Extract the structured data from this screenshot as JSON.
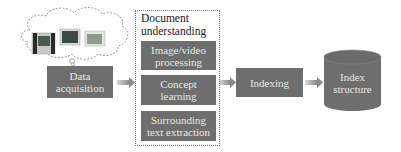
{
  "nodes": {
    "data_acquisition": "Data acquisition",
    "document_understanding": {
      "title": "Document understanding",
      "steps": [
        "Image/video processing",
        "Concept learning",
        "Surrounding text extraction"
      ]
    },
    "indexing": "Indexing",
    "index_structure": "Index structure"
  },
  "labels": {
    "data_acquisition_l1": "Data",
    "data_acquisition_l2": "acquisition",
    "doc_title_l1": "Document",
    "doc_title_l2": "understanding",
    "step1_l1": "Image/video",
    "step1_l2": "processing",
    "step2_l1": "Concept",
    "step2_l2": "learning",
    "step3_l1": "Surrounding",
    "step3_l2": "text extraction",
    "indexing": "Indexing",
    "index_l1": "Index",
    "index_l2": "structure"
  },
  "edges": [
    [
      "Data acquisition",
      "Document understanding"
    ],
    [
      "Document understanding",
      "Indexing"
    ],
    [
      "Indexing",
      "Index structure"
    ]
  ],
  "colors": {
    "box": "#6e6e6e",
    "box_text": "#e8e8e8",
    "arrow": "#9a9a9a"
  }
}
